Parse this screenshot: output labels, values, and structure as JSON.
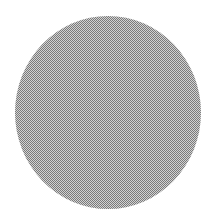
{
  "shape": {
    "type": "circle",
    "fill_style": "dithered-gray",
    "colors": {
      "dark": "#7a7a7a",
      "light": "#d2d2d2",
      "average": "#a9a9a9",
      "background": "#ffffff"
    }
  }
}
